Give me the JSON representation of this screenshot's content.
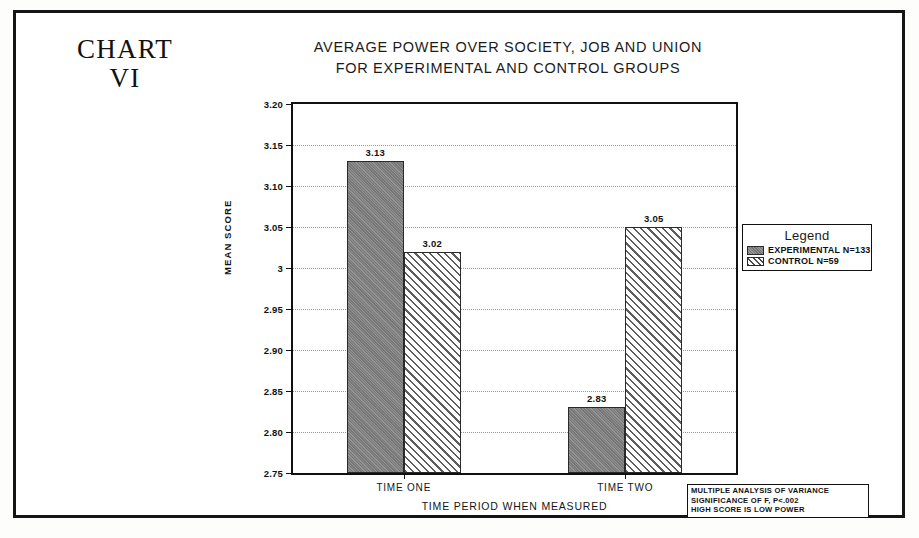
{
  "chart_label": {
    "line1": "CHART",
    "line2": "VI"
  },
  "title": {
    "line1": "AVERAGE POWER OVER SOCIETY, JOB AND UNION",
    "line2": "FOR EXPERIMENTAL AND CONTROL GROUPS"
  },
  "legend": {
    "title": "Legend",
    "items": [
      {
        "label": "EXPERIMENTAL N=133",
        "pattern": "solid",
        "color": "#7d7d7d"
      },
      {
        "label": "CONTROL N=59",
        "pattern": "hatch",
        "color": "#e9e9e9"
      }
    ]
  },
  "footnote": {
    "line1": "MULTIPLE ANALYSIS OF VARIANCE",
    "line2": "SIGNIFICANCE OF F, P<.002",
    "line3": "HIGH SCORE IS LOW POWER"
  },
  "axes": {
    "y_title": "MEAN SCORE",
    "x_title": "TIME PERIOD WHEN MEASURED",
    "y_ticks": [
      "3.20",
      "3.15",
      "3.10",
      "3.05",
      "3",
      "2.95",
      "2.90",
      "2.85",
      "2.80",
      "2.75"
    ]
  },
  "chart_data": {
    "type": "bar",
    "title": "AVERAGE POWER OVER SOCIETY, JOB AND UNION FOR EXPERIMENTAL AND CONTROL GROUPS",
    "xlabel": "TIME PERIOD WHEN MEASURED",
    "ylabel": "MEAN SCORE",
    "categories": [
      "TIME ONE",
      "TIME TWO"
    ],
    "series": [
      {
        "name": "EXPERIMENTAL N=133",
        "values": [
          3.13,
          2.83
        ],
        "labels": [
          "3.13",
          "2.83"
        ],
        "pattern": "solid",
        "color": "#7d7d7d"
      },
      {
        "name": "CONTROL N=59",
        "values": [
          3.02,
          3.05
        ],
        "labels": [
          "3.02",
          "3.05"
        ],
        "pattern": "hatch",
        "color": "#e9e9e9"
      }
    ],
    "ylim": [
      2.75,
      3.2
    ],
    "ytick_values": [
      3.2,
      3.15,
      3.1,
      3.05,
      3.0,
      2.95,
      2.9,
      2.85,
      2.8,
      2.75
    ],
    "ytick_labels": [
      "3.20",
      "3.15",
      "3.10",
      "3.05",
      "3",
      "2.95",
      "2.90",
      "2.85",
      "2.80",
      "2.75"
    ],
    "grid": true,
    "legend_position": "right",
    "annotations": [
      "MULTIPLE ANALYSIS OF VARIANCE",
      "SIGNIFICANCE OF F, P<.002",
      "HIGH SCORE IS LOW POWER"
    ]
  }
}
